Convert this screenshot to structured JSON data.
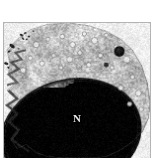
{
  "figure": {
    "kind": "transmission-electron-micrograph",
    "caption_text": "",
    "background_color": "#ffffff",
    "frame_color": "#b4b4b4",
    "frame": {
      "x": 3,
      "y": 22,
      "width": 148,
      "height": 136
    }
  },
  "annotations": [
    {
      "id": "nucleus",
      "label": "N",
      "x": 72,
      "y": 112,
      "color": "#e8e8e8",
      "description": "nucleus"
    }
  ],
  "structures": [
    {
      "name": "cell-body",
      "tone": "#b9b9b9",
      "description": "whole cell occupying frame"
    },
    {
      "name": "cytoplasm",
      "tone": "#c9c9c9",
      "description": "granular cytoplasm upper region"
    },
    {
      "name": "nucleus",
      "tone": "#6a6a6a",
      "description": "large dark heterochromatic nucleus lower-centre"
    },
    {
      "name": "nuclear-envelope",
      "tone": "#262626",
      "description": "dark curved double membrane"
    },
    {
      "name": "dense-body",
      "tone": "#1e1e1e",
      "description": "electron-dense lysosome upper right"
    },
    {
      "name": "electron-dense-granules",
      "tone": "#141414",
      "description": "dark granule clusters upper left / outside cell"
    },
    {
      "name": "vesicles",
      "tone": "#e4e4e4",
      "description": "pale round vesicles within cytoplasm"
    },
    {
      "name": "cell-membrane",
      "tone": "#555555",
      "description": "irregular ruffled plasma membrane at left"
    },
    {
      "name": "extracellular-space",
      "tone": "#f2f2f2",
      "description": "pale background outside the cell"
    }
  ],
  "palette": {
    "page_background": "#ffffff",
    "frame_line": "#b4b4b4",
    "extracellular": "#f1f1f1",
    "cytoplasm_light": "#d2d2d2",
    "cytoplasm_mid": "#b0b0b0",
    "nucleus_mid": "#707070",
    "nucleus_dark": "#3c3c3c",
    "envelope": "#1c1c1c",
    "label_text": "#e8e8e8"
  }
}
